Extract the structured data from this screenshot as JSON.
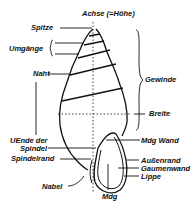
{
  "diagram": {
    "labels": {
      "axis": "Achse (=Höhe)",
      "apex": "Spitze",
      "whorls": "Umgänge",
      "suture": "Naht",
      "spire": "Gewinde",
      "width": "Breite",
      "lower_end_spindle_line1": "UEnde der",
      "lower_end_spindle_line2": "Spindel",
      "columellar_margin": "Spindelrand",
      "umbilicus": "Nabel",
      "aperture_wall": "Mdg Wand",
      "outer_margin": "Außenrand",
      "palatal_wall": "Gaumenwand",
      "lip": "Lippe",
      "aperture": "Mdg"
    },
    "colors": {
      "ink": "#111111",
      "background": "#ffffff"
    }
  }
}
